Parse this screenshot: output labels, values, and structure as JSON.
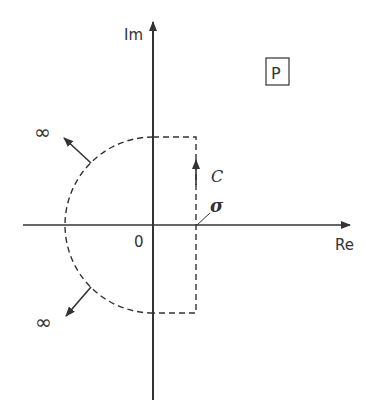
{
  "diagram": {
    "axes": {
      "imag_label": "Im",
      "real_label": "Re",
      "origin_label": "0"
    },
    "plane_label": "P",
    "contour_label": "C",
    "sigma_label": "σ",
    "infinity_top": "∞",
    "infinity_bottom": "∞",
    "colors": {
      "ink": "#333333",
      "background": "#ffffff"
    }
  }
}
